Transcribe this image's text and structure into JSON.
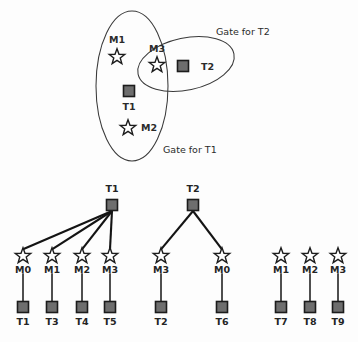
{
  "figure": {
    "colors": {
      "background": "#fdfdfd",
      "node_fill": "#6e6e6e",
      "node_stroke": "#1c1c1c",
      "star_fill": "#ffffff",
      "star_stroke": "#1c1c1c",
      "ellipse_stroke": "#3a3a3a",
      "edge": "#141414",
      "text": "#2b2b2b"
    }
  },
  "top_panel": {
    "name": "gate-venn-panel",
    "gates": [
      {
        "id": "gate-t1",
        "label": "Gate for T1",
        "label_x": 163,
        "label_y": 153,
        "cx": 132,
        "cy": 86,
        "rx": 36,
        "ry": 75,
        "rotation": 0
      },
      {
        "id": "gate-t2",
        "label": "Gate for T2",
        "label_x": 216,
        "label_y": 35,
        "cx": 186,
        "cy": 64,
        "rx": 49,
        "ry": 26,
        "rotation": -12
      }
    ],
    "machines": [
      {
        "id": "m1",
        "label": "M1",
        "x": 117,
        "y": 57,
        "label_x": 117,
        "label_y": 43,
        "label_anchor": "middle"
      },
      {
        "id": "m3",
        "label": "M3",
        "x": 157,
        "y": 65,
        "label_x": 157,
        "label_y": 52,
        "label_anchor": "middle"
      },
      {
        "id": "m2",
        "label": "M2",
        "x": 128,
        "y": 128,
        "label_x": 141,
        "label_y": 131,
        "label_anchor": "start"
      }
    ],
    "tasks": [
      {
        "id": "t1",
        "label": "T1",
        "x": 129,
        "y": 91,
        "label_x": 129,
        "label_y": 110,
        "label_anchor": "middle"
      },
      {
        "id": "t2",
        "label": "T2",
        "x": 183,
        "y": 66,
        "label_x": 201,
        "label_y": 70,
        "label_anchor": "start"
      }
    ]
  },
  "bottom_panel": {
    "name": "assignment-tree-panel",
    "groups": [
      {
        "id": "tree-t1",
        "root": {
          "id": "root-t1",
          "label": "T1",
          "x": 112,
          "y": 205,
          "label_x": 112,
          "label_y": 192
        },
        "machines": [
          {
            "id": "m0-a",
            "label": "M0",
            "x": 23,
            "y": 256,
            "label_y": 273
          },
          {
            "id": "m1-a",
            "label": "M1",
            "x": 52,
            "y": 256,
            "label_y": 273
          },
          {
            "id": "m2-a",
            "label": "M2",
            "x": 82,
            "y": 256,
            "label_y": 273
          },
          {
            "id": "m3-a",
            "label": "M3",
            "x": 110,
            "y": 256,
            "label_y": 273
          }
        ],
        "tasks": [
          {
            "id": "t1-leaf",
            "label": "T1",
            "x": 23,
            "y": 307,
            "label_y": 325
          },
          {
            "id": "t3-leaf",
            "label": "T3",
            "x": 52,
            "y": 307,
            "label_y": 325
          },
          {
            "id": "t4-leaf",
            "label": "T4",
            "x": 82,
            "y": 307,
            "label_y": 325
          },
          {
            "id": "t5-leaf",
            "label": "T5",
            "x": 110,
            "y": 307,
            "label_y": 325
          }
        ]
      },
      {
        "id": "tree-t2",
        "root": {
          "id": "root-t2",
          "label": "T2",
          "x": 193,
          "y": 205,
          "label_x": 193,
          "label_y": 192
        },
        "machines": [
          {
            "id": "m3-b",
            "label": "M3",
            "x": 161,
            "y": 256,
            "label_y": 273
          },
          {
            "id": "m0-b",
            "label": "M0",
            "x": 222,
            "y": 256,
            "label_y": 273
          }
        ],
        "tasks": [
          {
            "id": "t2-leaf",
            "label": "T2",
            "x": 161,
            "y": 307,
            "label_y": 325
          },
          {
            "id": "t6-leaf",
            "label": "T6",
            "x": 222,
            "y": 307,
            "label_y": 325
          }
        ]
      },
      {
        "id": "tree-orphans",
        "root": null,
        "machines": [
          {
            "id": "m1-c",
            "label": "M1",
            "x": 281,
            "y": 256,
            "label_y": 273
          },
          {
            "id": "m2-c",
            "label": "M2",
            "x": 310,
            "y": 256,
            "label_y": 273
          },
          {
            "id": "m3-c",
            "label": "M3",
            "x": 338,
            "y": 256,
            "label_y": 273
          }
        ],
        "tasks": [
          {
            "id": "t7-leaf",
            "label": "T7",
            "x": 281,
            "y": 307,
            "label_y": 325
          },
          {
            "id": "t8-leaf",
            "label": "T8",
            "x": 310,
            "y": 307,
            "label_y": 325
          },
          {
            "id": "t9-leaf",
            "label": "T9",
            "x": 338,
            "y": 307,
            "label_y": 325
          }
        ]
      }
    ]
  }
}
